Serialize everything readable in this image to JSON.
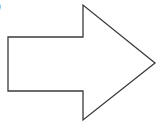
{
  "diagram": {
    "type": "block-arrow",
    "direction": "right",
    "stroke_color": "#3a3a3a",
    "fill_color": "#ffffff",
    "stroke_width": 1.3,
    "points": [
      [
        8,
        37
      ],
      [
        83,
        37
      ],
      [
        83,
        5
      ],
      [
        155,
        63
      ],
      [
        83,
        120
      ],
      [
        83,
        91
      ],
      [
        8,
        91
      ]
    ],
    "edge_mark": ")"
  }
}
